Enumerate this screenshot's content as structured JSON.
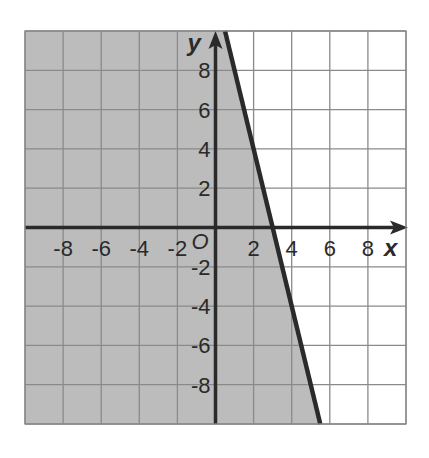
{
  "chart_data": {
    "type": "inequality-graph",
    "title": "",
    "xlabel": "x",
    "ylabel": "y",
    "origin_label": "O",
    "xlim": [
      -10,
      10
    ],
    "ylim": [
      -10,
      10
    ],
    "grid": true,
    "grid_step": 2,
    "x_ticks": [
      -8,
      -6,
      -4,
      -2,
      2,
      4,
      6,
      8
    ],
    "y_ticks": [
      8,
      6,
      4,
      2,
      -2,
      -4,
      -6,
      -8
    ],
    "boundary_line": {
      "equation": "y = -4x + 12",
      "slope": -4,
      "y_intercept": 12,
      "x_intercept": 3,
      "style": "solid",
      "points": [
        [
          0.5,
          10
        ],
        [
          5.5,
          -10
        ]
      ]
    },
    "shaded_region": "left of / below the line (y <= -4x + 12)",
    "inequality": "y <= -4x + 12"
  },
  "colors": {
    "shade": "#bcbcbc",
    "grid": "#8a8a8a",
    "axis": "#2a2a2a",
    "line": "#2a2a2a",
    "background": "#ffffff"
  }
}
